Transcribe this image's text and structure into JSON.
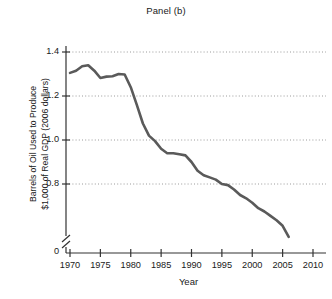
{
  "chart_data": {
    "type": "line",
    "title": "Panel (b)",
    "xlabel": "Year",
    "ylabel": "Barrels of Oil Used to Produce $1,000 of Real GDP (2006 dollars)",
    "ylabel_lines": [
      "Barrels of Oil Used to Produce",
      "$1,000 of Real GDP (2006 dollars)"
    ],
    "xlim": [
      1970,
      2010
    ],
    "ylim": [
      0.5,
      1.4
    ],
    "y_axis_break": true,
    "y_zero_label": "0",
    "grid": "horizontal-dotted",
    "legend": "none",
    "line_color": "#5a5a5a",
    "grid_color": "#8f8f8f",
    "axis_color": "#333333",
    "xticks": [
      1970,
      1975,
      1980,
      1985,
      1990,
      1995,
      2000,
      2005,
      2010
    ],
    "xtick_labels": [
      "1970",
      "1975",
      "1980",
      "1985",
      "1990",
      "1995",
      "2000",
      "2005",
      "2010"
    ],
    "yticks": [
      0.8,
      1.0,
      1.2,
      1.4
    ],
    "ytick_labels": [
      "0.8",
      "1.0",
      "1.2",
      "1.4"
    ],
    "series": [
      {
        "name": "Barrels of oil per $1,000 real GDP",
        "x": [
          1970,
          1971,
          1972,
          1973,
          1974,
          1975,
          1976,
          1977,
          1978,
          1979,
          1980,
          1981,
          1982,
          1983,
          1984,
          1985,
          1986,
          1987,
          1988,
          1989,
          1990,
          1991,
          1992,
          1993,
          1994,
          1995,
          1996,
          1997,
          1998,
          1999,
          2000,
          2001,
          2002,
          2003,
          2004,
          2005,
          2006
        ],
        "values": [
          1.305,
          1.315,
          1.335,
          1.34,
          1.315,
          1.282,
          1.288,
          1.29,
          1.3,
          1.298,
          1.24,
          1.16,
          1.075,
          1.02,
          0.995,
          0.96,
          0.94,
          0.94,
          0.935,
          0.93,
          0.9,
          0.86,
          0.84,
          0.83,
          0.82,
          0.8,
          0.795,
          0.775,
          0.75,
          0.735,
          0.715,
          0.69,
          0.675,
          0.655,
          0.635,
          0.61,
          0.56
        ]
      }
    ]
  }
}
